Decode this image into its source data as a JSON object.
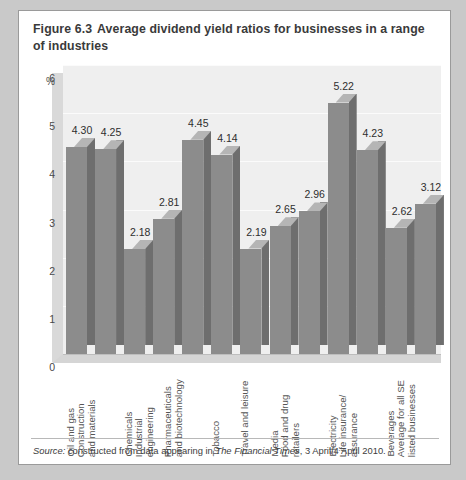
{
  "figure": {
    "number": "Figure 6.3",
    "caption": "Average dividend yield ratios for businesses in a range of industries"
  },
  "source": {
    "label": "Source:",
    "text_before": " constructed from data appearing in ",
    "publication": "The Financial Times",
    "text_after": ", 3 April/4 April 2010."
  },
  "chart_data": {
    "type": "bar",
    "title": "Average dividend yield ratios for businesses in a range of industries",
    "xlabel": "",
    "ylabel": "%",
    "ylim": [
      0,
      6
    ],
    "yticks": [
      "0",
      "1",
      "2",
      "3",
      "4",
      "5",
      "6"
    ],
    "grid": true,
    "legend": "none",
    "categories": [
      "Oil and gas",
      "Construction and materials",
      "Chemicals",
      "Industrial engineering",
      "Pharmaceuticals and biotechnology",
      "Tobacco",
      "Travel and leisure",
      "Media",
      "Food and drug retailers",
      "Electricity",
      "Life insurance/assurance",
      "Beverages",
      "Average for all SE listed businesses"
    ],
    "category_lines": [
      [
        "Oil and gas"
      ],
      [
        "Construction",
        "and materials"
      ],
      [
        "Chemicals"
      ],
      [
        "Industrial",
        "engineering"
      ],
      [
        "Pharmaceuticals",
        "and biotechnology"
      ],
      [
        "Tobacco"
      ],
      [
        "Travel and leisure"
      ],
      [
        "Media"
      ],
      [
        "Food and drug",
        "retailers"
      ],
      [
        "Electricity"
      ],
      [
        "Life insurance/",
        "assurance"
      ],
      [
        "Beverages"
      ],
      [
        "Average for all SE",
        "listed businesses"
      ]
    ],
    "values": [
      4.3,
      4.25,
      2.18,
      2.81,
      4.45,
      4.14,
      2.19,
      2.65,
      2.96,
      5.22,
      4.23,
      2.62,
      3.12
    ],
    "value_labels": [
      "4.30",
      "4.25",
      "2.18",
      "2.81",
      "4.45",
      "4.14",
      "2.19",
      "2.65",
      "2.96",
      "5.22",
      "4.23",
      "2.62",
      "3.12"
    ],
    "colors": {
      "bar_front": "#8c8c8c",
      "bar_side": "#6e6e6e",
      "bar_top": "#b5b5b5",
      "plot_background": "#efefef",
      "page_background": "#c9c9c9"
    }
  }
}
